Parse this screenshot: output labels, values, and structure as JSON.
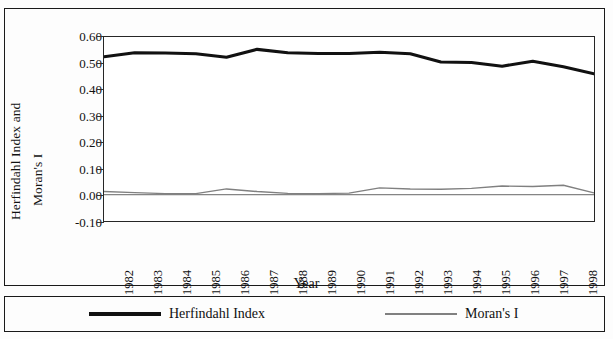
{
  "chart_data": {
    "type": "line",
    "title": "",
    "xlabel": "Year",
    "ylabel": "Herfindahl Index and Moran's I",
    "ylabel_line1": "Herfindahl Index and",
    "ylabel_line2": "Moran's I",
    "categories": [
      "1982",
      "1983",
      "1984",
      "1985",
      "1986",
      "1987",
      "1988",
      "1989",
      "1990",
      "1991",
      "1992",
      "1993",
      "1994",
      "1995",
      "1996",
      "1997",
      "1998"
    ],
    "ytick_labels": [
      "0.60",
      "0.50",
      "0.40",
      "0.30",
      "0.20",
      "0.10",
      "0.00",
      "-0.10"
    ],
    "ytick_values": [
      0.6,
      0.5,
      0.4,
      0.3,
      0.2,
      0.1,
      0.0,
      -0.1
    ],
    "ylim": [
      -0.1,
      0.6
    ],
    "grid": false,
    "legend_position": "bottom",
    "series": [
      {
        "name": "Herfindahl Index",
        "color": "#111111",
        "width": 3.1,
        "values": [
          0.525,
          0.54,
          0.539,
          0.536,
          0.523,
          0.553,
          0.54,
          0.537,
          0.537,
          0.542,
          0.536,
          0.505,
          0.503,
          0.489,
          0.508,
          0.487,
          0.46
        ]
      },
      {
        "name": "Moran's I",
        "color": "#808080",
        "width": 1.4,
        "values": [
          0.012,
          0.008,
          0.004,
          0.004,
          0.022,
          0.012,
          0.005,
          0.004,
          0.006,
          0.026,
          0.022,
          0.021,
          0.024,
          0.033,
          0.031,
          0.036,
          0.007
        ]
      }
    ]
  }
}
